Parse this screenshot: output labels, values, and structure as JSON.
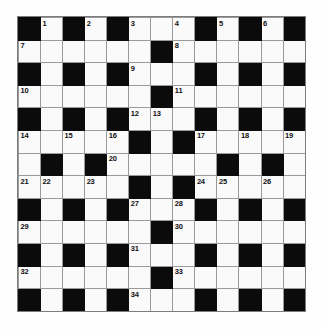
{
  "puzzle": {
    "title": "Crossword Grid",
    "rows": 13,
    "columns": 13,
    "cell_size_px": 22,
    "colors": {
      "light_cell": "#fafafa",
      "dark_cell": "#0b0b0b",
      "grid_line": "#9a9a9a",
      "number_text": "#101010",
      "page_background": "#fdfdfd"
    },
    "max_clue_number": 34,
    "grid": [
      [
        {
          "type": "block",
          "number": null
        },
        {
          "type": "open",
          "number": "1"
        },
        {
          "type": "block",
          "number": null
        },
        {
          "type": "open",
          "number": "2"
        },
        {
          "type": "block",
          "number": null
        },
        {
          "type": "open",
          "number": "3"
        },
        {
          "type": "open",
          "number": null
        },
        {
          "type": "open",
          "number": "4"
        },
        {
          "type": "block",
          "number": null
        },
        {
          "type": "open",
          "number": "5"
        },
        {
          "type": "block",
          "number": null
        },
        {
          "type": "open",
          "number": "6"
        },
        {
          "type": "block",
          "number": null
        }
      ],
      [
        {
          "type": "open",
          "number": "7"
        },
        {
          "type": "open",
          "number": null
        },
        {
          "type": "open",
          "number": null
        },
        {
          "type": "open",
          "number": null
        },
        {
          "type": "open",
          "number": null
        },
        {
          "type": "open",
          "number": null
        },
        {
          "type": "block",
          "number": null
        },
        {
          "type": "open",
          "number": "8"
        },
        {
          "type": "open",
          "number": null
        },
        {
          "type": "open",
          "number": null
        },
        {
          "type": "open",
          "number": null
        },
        {
          "type": "open",
          "number": null
        },
        {
          "type": "open",
          "number": null
        }
      ],
      [
        {
          "type": "block",
          "number": null
        },
        {
          "type": "open",
          "number": null
        },
        {
          "type": "block",
          "number": null
        },
        {
          "type": "open",
          "number": null
        },
        {
          "type": "block",
          "number": null
        },
        {
          "type": "open",
          "number": "9"
        },
        {
          "type": "open",
          "number": null
        },
        {
          "type": "open",
          "number": null
        },
        {
          "type": "block",
          "number": null
        },
        {
          "type": "open",
          "number": null
        },
        {
          "type": "block",
          "number": null
        },
        {
          "type": "open",
          "number": null
        },
        {
          "type": "block",
          "number": null
        }
      ],
      [
        {
          "type": "open",
          "number": "10"
        },
        {
          "type": "open",
          "number": null
        },
        {
          "type": "open",
          "number": null
        },
        {
          "type": "open",
          "number": null
        },
        {
          "type": "open",
          "number": null
        },
        {
          "type": "open",
          "number": null
        },
        {
          "type": "block",
          "number": null
        },
        {
          "type": "open",
          "number": "11"
        },
        {
          "type": "open",
          "number": null
        },
        {
          "type": "open",
          "number": null
        },
        {
          "type": "open",
          "number": null
        },
        {
          "type": "open",
          "number": null
        },
        {
          "type": "open",
          "number": null
        }
      ],
      [
        {
          "type": "block",
          "number": null
        },
        {
          "type": "open",
          "number": null
        },
        {
          "type": "block",
          "number": null
        },
        {
          "type": "open",
          "number": null
        },
        {
          "type": "block",
          "number": null
        },
        {
          "type": "open",
          "number": "12"
        },
        {
          "type": "open",
          "number": "13"
        },
        {
          "type": "open",
          "number": null
        },
        {
          "type": "block",
          "number": null
        },
        {
          "type": "open",
          "number": null
        },
        {
          "type": "block",
          "number": null
        },
        {
          "type": "open",
          "number": null
        },
        {
          "type": "block",
          "number": null
        }
      ],
      [
        {
          "type": "open",
          "number": "14"
        },
        {
          "type": "open",
          "number": null
        },
        {
          "type": "open",
          "number": "15"
        },
        {
          "type": "open",
          "number": null
        },
        {
          "type": "open",
          "number": "16"
        },
        {
          "type": "block",
          "number": null
        },
        {
          "type": "open",
          "number": null
        },
        {
          "type": "block",
          "number": null
        },
        {
          "type": "open",
          "number": "17"
        },
        {
          "type": "open",
          "number": null
        },
        {
          "type": "open",
          "number": "18"
        },
        {
          "type": "open",
          "number": null
        },
        {
          "type": "open",
          "number": "19"
        }
      ],
      [
        {
          "type": "open",
          "number": null
        },
        {
          "type": "block",
          "number": null
        },
        {
          "type": "open",
          "number": null
        },
        {
          "type": "block",
          "number": null
        },
        {
          "type": "open",
          "number": "20"
        },
        {
          "type": "open",
          "number": null
        },
        {
          "type": "open",
          "number": null
        },
        {
          "type": "open",
          "number": null
        },
        {
          "type": "open",
          "number": null
        },
        {
          "type": "block",
          "number": null
        },
        {
          "type": "open",
          "number": null
        },
        {
          "type": "block",
          "number": null
        },
        {
          "type": "open",
          "number": null
        }
      ],
      [
        {
          "type": "open",
          "number": "21"
        },
        {
          "type": "open",
          "number": "22"
        },
        {
          "type": "open",
          "number": null
        },
        {
          "type": "open",
          "number": "23"
        },
        {
          "type": "open",
          "number": null
        },
        {
          "type": "block",
          "number": null
        },
        {
          "type": "open",
          "number": null
        },
        {
          "type": "block",
          "number": null
        },
        {
          "type": "open",
          "number": "24"
        },
        {
          "type": "open",
          "number": "25"
        },
        {
          "type": "open",
          "number": null
        },
        {
          "type": "open",
          "number": "26"
        },
        {
          "type": "open",
          "number": null
        }
      ],
      [
        {
          "type": "block",
          "number": null
        },
        {
          "type": "open",
          "number": null
        },
        {
          "type": "block",
          "number": null
        },
        {
          "type": "open",
          "number": null
        },
        {
          "type": "block",
          "number": null
        },
        {
          "type": "open",
          "number": "27"
        },
        {
          "type": "open",
          "number": null
        },
        {
          "type": "open",
          "number": "28"
        },
        {
          "type": "block",
          "number": null
        },
        {
          "type": "open",
          "number": null
        },
        {
          "type": "block",
          "number": null
        },
        {
          "type": "open",
          "number": null
        },
        {
          "type": "block",
          "number": null
        }
      ],
      [
        {
          "type": "open",
          "number": "29"
        },
        {
          "type": "open",
          "number": null
        },
        {
          "type": "open",
          "number": null
        },
        {
          "type": "open",
          "number": null
        },
        {
          "type": "open",
          "number": null
        },
        {
          "type": "open",
          "number": null
        },
        {
          "type": "block",
          "number": null
        },
        {
          "type": "open",
          "number": "30"
        },
        {
          "type": "open",
          "number": null
        },
        {
          "type": "open",
          "number": null
        },
        {
          "type": "open",
          "number": null
        },
        {
          "type": "open",
          "number": null
        },
        {
          "type": "open",
          "number": null
        }
      ],
      [
        {
          "type": "block",
          "number": null
        },
        {
          "type": "open",
          "number": null
        },
        {
          "type": "block",
          "number": null
        },
        {
          "type": "open",
          "number": null
        },
        {
          "type": "block",
          "number": null
        },
        {
          "type": "open",
          "number": "31"
        },
        {
          "type": "open",
          "number": null
        },
        {
          "type": "open",
          "number": null
        },
        {
          "type": "block",
          "number": null
        },
        {
          "type": "open",
          "number": null
        },
        {
          "type": "block",
          "number": null
        },
        {
          "type": "open",
          "number": null
        },
        {
          "type": "block",
          "number": null
        }
      ],
      [
        {
          "type": "open",
          "number": "32"
        },
        {
          "type": "open",
          "number": null
        },
        {
          "type": "open",
          "number": null
        },
        {
          "type": "open",
          "number": null
        },
        {
          "type": "open",
          "number": null
        },
        {
          "type": "open",
          "number": null
        },
        {
          "type": "block",
          "number": null
        },
        {
          "type": "open",
          "number": "33"
        },
        {
          "type": "open",
          "number": null
        },
        {
          "type": "open",
          "number": null
        },
        {
          "type": "open",
          "number": null
        },
        {
          "type": "open",
          "number": null
        },
        {
          "type": "open",
          "number": null
        }
      ],
      [
        {
          "type": "block",
          "number": null
        },
        {
          "type": "open",
          "number": null
        },
        {
          "type": "block",
          "number": null
        },
        {
          "type": "open",
          "number": null
        },
        {
          "type": "block",
          "number": null
        },
        {
          "type": "open",
          "number": "34"
        },
        {
          "type": "open",
          "number": null
        },
        {
          "type": "open",
          "number": null
        },
        {
          "type": "block",
          "number": null
        },
        {
          "type": "open",
          "number": null
        },
        {
          "type": "block",
          "number": null
        },
        {
          "type": "open",
          "number": null
        },
        {
          "type": "block",
          "number": null
        }
      ]
    ]
  }
}
